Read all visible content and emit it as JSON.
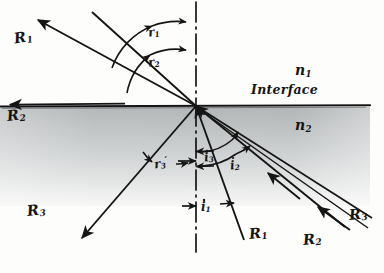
{
  "figure": {
    "kind": "optics-ray-diagram",
    "ink_color": "#151515",
    "medium_upper_color": "#ffffff",
    "medium_lower_color": "#b9bcbd"
  },
  "media": {
    "upper_label": "n",
    "upper_sub": "1",
    "lower_label": "n",
    "lower_sub": "2",
    "interface_label": "Interface"
  },
  "rays": [
    {
      "key": "R1_upper_left",
      "label": "R",
      "sub": "1"
    },
    {
      "key": "R2_interface",
      "label": "R",
      "sub": "2"
    },
    {
      "key": "R3_lower_left",
      "label": "R",
      "sub": "3"
    },
    {
      "key": "R1_lower",
      "label": "R",
      "sub": "1"
    },
    {
      "key": "R2_lower",
      "label": "R",
      "sub": "2"
    },
    {
      "key": "R3_lower_right",
      "label": "R",
      "sub": "3"
    }
  ],
  "angles": [
    {
      "key": "r1",
      "label": "r",
      "sub": "1",
      "prime": ""
    },
    {
      "key": "r2",
      "label": "r",
      "sub": "2",
      "prime": ""
    },
    {
      "key": "r3p",
      "label": "r",
      "sub": "3",
      "prime": "′"
    },
    {
      "key": "i1",
      "label": "i",
      "sub": "1",
      "prime": ""
    },
    {
      "key": "i2",
      "label": "i",
      "sub": "2",
      "prime": ""
    },
    {
      "key": "i3",
      "label": "i",
      "sub": "3",
      "prime": ""
    }
  ],
  "geometry": {
    "vertex_x": 196,
    "vertex_y": 106,
    "normal_x": 196,
    "interface_y": 106,
    "interface_x_start": 0,
    "interface_x_end": 370
  }
}
